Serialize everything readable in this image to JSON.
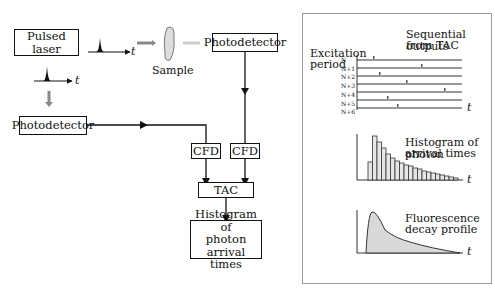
{
  "left_diagram": {
    "pulsed_laser": "Pulsed laser",
    "sample": "Sample",
    "photodetector_top": "Photodetector",
    "photodetector_left": "Photodetector",
    "cfd_left": "CFD",
    "cfd_right": "CFD",
    "tac": "TAC",
    "histogram_line1": "Histogram of",
    "histogram_line2": "photon arrival",
    "histogram_line3": "times",
    "time_axis_label": "t"
  },
  "right_panel": {
    "excitation_line1": "Excitation",
    "excitation_line2": "period",
    "sequential_line1": "Sequential outputs",
    "sequential_line2": "from TAC",
    "periods": [
      "N",
      "N+1",
      "N+2",
      "N+3",
      "N+4",
      "N+5",
      "N+6"
    ],
    "histogram_line1": "Histogram of photon",
    "histogram_line2": "arrival times",
    "decay_line1": "Fluorescence",
    "decay_line2": "decay profile",
    "time_axis_label": "t"
  },
  "colors": {
    "line": "#111111",
    "grey_arrow": "#888888",
    "light_grey_arrow": "#cccccc",
    "panel_border": "#9a9a9a",
    "fill_grey": "#d9d9d9"
  }
}
